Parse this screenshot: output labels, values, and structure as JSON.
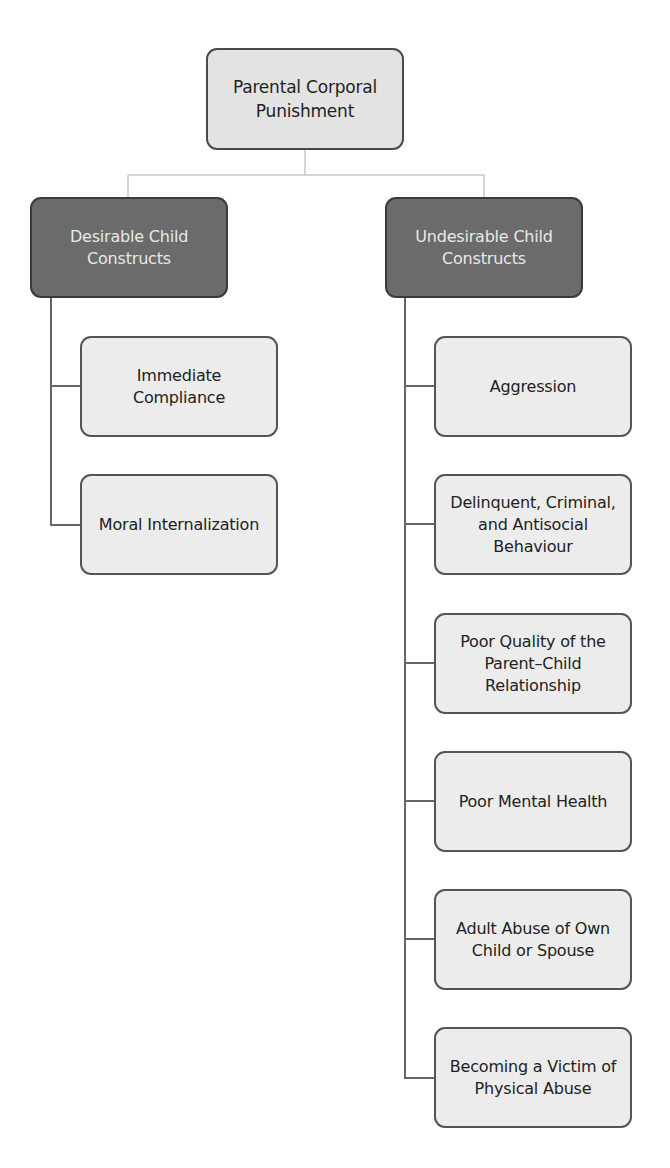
{
  "diagram": {
    "type": "hierarchy",
    "colors": {
      "root_fill": "#e3e3e3",
      "category_fill": "#6b6b6b",
      "category_text": "#e8e8e8",
      "leaf_fill": "#ececec",
      "border": "#555555",
      "top_connector": "#c8c8c8",
      "child_connector": "#666666"
    },
    "root": {
      "label_line1": "Parental Corporal",
      "label_line2": "Punishment"
    },
    "categories": [
      {
        "label_line1": "Desirable Child",
        "label_line2": "Constructs",
        "children": [
          {
            "lines": [
              "Immediate",
              "Compliance"
            ]
          },
          {
            "lines": [
              "Moral Internalization"
            ]
          }
        ]
      },
      {
        "label_line1": "Undesirable Child",
        "label_line2": "Constructs",
        "children": [
          {
            "lines": [
              "Aggression"
            ]
          },
          {
            "lines": [
              "Delinquent, Criminal,",
              "and Antisocial",
              "Behaviour"
            ]
          },
          {
            "lines": [
              "Poor Quality of the",
              "Parent–Child",
              "Relationship"
            ]
          },
          {
            "lines": [
              "Poor Mental Health"
            ]
          },
          {
            "lines": [
              "Adult Abuse of Own",
              "Child or Spouse"
            ]
          },
          {
            "lines": [
              "Becoming a Victim of",
              "Physical Abuse"
            ]
          }
        ]
      }
    ]
  }
}
